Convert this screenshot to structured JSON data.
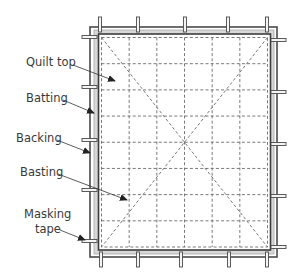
{
  "diagram": {
    "colors": {
      "line": "#4a4a4a",
      "batting": "#d4d4d4",
      "basting": "#6a6a6a",
      "tape_fill": "#f2f2f2",
      "text": "#3a3a3a"
    },
    "grid": {
      "columns": 6,
      "rows": 8
    },
    "tape_tabs": {
      "top_x": [
        100,
        138,
        185,
        228,
        267
      ],
      "bottom_x": [
        101,
        138,
        181,
        229,
        267
      ],
      "left_y": [
        37,
        87,
        140,
        190,
        241
      ],
      "right_y": [
        40,
        92,
        144,
        196,
        247
      ]
    },
    "labels": [
      {
        "id": "quilt-top",
        "text": "Quilt top"
      },
      {
        "id": "batting",
        "text": "Batting"
      },
      {
        "id": "backing",
        "text": "Backing"
      },
      {
        "id": "basting",
        "text": "Basting"
      },
      {
        "id": "masking-tape-line1",
        "text": "Masking"
      },
      {
        "id": "masking-tape-line2",
        "text": "tape"
      }
    ]
  }
}
